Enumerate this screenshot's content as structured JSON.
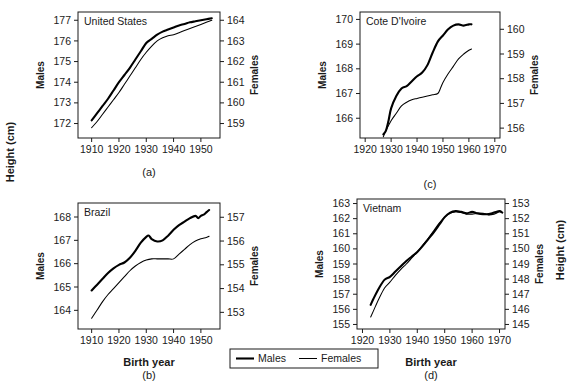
{
  "figure": {
    "global_ylabel_left": "Height (cm)",
    "global_ylabel_right": "Height (cm)",
    "global_xlabel": "Birth year",
    "axis_label_males": "Males",
    "axis_label_females": "Females",
    "legend": {
      "position": "bottom-center",
      "entries": [
        {
          "label": "Males",
          "color": "#000000",
          "width": 2.2
        },
        {
          "label": "Females",
          "color": "#000000",
          "width": 1.1
        }
      ]
    },
    "panel_captions": [
      "(a)",
      "(b)",
      "(c)",
      "(d)"
    ]
  },
  "chart_data": [
    {
      "panel": "(a)",
      "type": "line",
      "title": "United States",
      "xlabel": "Birth year",
      "ylabel_left": "Males",
      "ylabel_right": "Females",
      "xlim": [
        1905,
        1957
      ],
      "xticks": [
        1910,
        1920,
        1930,
        1940,
        1950
      ],
      "ylim_left": [
        171.3,
        177.4
      ],
      "yticks_left": [
        172,
        173,
        174,
        175,
        176,
        177
      ],
      "ylim_right": [
        158.3,
        164.4
      ],
      "yticks_right": [
        159,
        160,
        161,
        162,
        163,
        164
      ],
      "grid": false,
      "series": [
        {
          "name": "Males",
          "axis": "left",
          "x": [
            1910,
            1912,
            1914,
            1916,
            1918,
            1920,
            1922,
            1924,
            1926,
            1928,
            1930,
            1932,
            1934,
            1936,
            1938,
            1940,
            1942,
            1944,
            1946,
            1948,
            1950,
            1952,
            1954
          ],
          "values": [
            172.15,
            172.5,
            172.85,
            173.2,
            173.6,
            174.0,
            174.35,
            174.7,
            175.1,
            175.5,
            175.9,
            176.1,
            176.3,
            176.45,
            176.55,
            176.65,
            176.75,
            176.82,
            176.9,
            176.95,
            177.0,
            177.05,
            177.1
          ]
        },
        {
          "name": "Females",
          "axis": "right",
          "x": [
            1910,
            1912,
            1914,
            1916,
            1918,
            1920,
            1922,
            1924,
            1926,
            1928,
            1930,
            1932,
            1934,
            1936,
            1938,
            1940,
            1942,
            1944,
            1946,
            1948,
            1950,
            1952,
            1954
          ],
          "values": [
            158.8,
            159.1,
            159.45,
            159.8,
            160.15,
            160.5,
            160.9,
            161.3,
            161.7,
            162.1,
            162.45,
            162.75,
            163.0,
            163.15,
            163.25,
            163.3,
            163.4,
            163.5,
            163.6,
            163.7,
            163.8,
            163.9,
            164.0
          ]
        }
      ]
    },
    {
      "panel": "(b)",
      "type": "line",
      "title": "Brazil",
      "xlabel": "Birth year",
      "ylabel_left": "Males",
      "ylabel_right": "Females",
      "xlim": [
        1905,
        1957
      ],
      "xticks": [
        1910,
        1920,
        1930,
        1940,
        1950
      ],
      "ylim_left": [
        163.2,
        168.6
      ],
      "yticks_left": [
        164,
        165,
        166,
        167,
        168
      ],
      "ylim_right": [
        152.3,
        157.6
      ],
      "yticks_right": [
        153,
        154,
        155,
        156,
        157
      ],
      "grid": false,
      "series": [
        {
          "name": "Males",
          "axis": "left",
          "x": [
            1910,
            1912,
            1914,
            1916,
            1918,
            1920,
            1922,
            1924,
            1926,
            1928,
            1930,
            1931,
            1932,
            1934,
            1936,
            1938,
            1940,
            1942,
            1944,
            1946,
            1948,
            1949,
            1950,
            1951,
            1952,
            1953
          ],
          "values": [
            164.85,
            165.1,
            165.35,
            165.6,
            165.8,
            165.95,
            166.05,
            166.25,
            166.55,
            166.9,
            167.15,
            167.2,
            167.05,
            166.95,
            167.0,
            167.2,
            167.45,
            167.65,
            167.8,
            167.95,
            168.05,
            167.95,
            168.05,
            168.1,
            168.2,
            168.3
          ]
        },
        {
          "name": "Females",
          "axis": "right",
          "x": [
            1910,
            1912,
            1914,
            1916,
            1918,
            1920,
            1922,
            1924,
            1926,
            1928,
            1930,
            1932,
            1934,
            1936,
            1938,
            1940,
            1942,
            1944,
            1946,
            1948,
            1950,
            1952,
            1953
          ],
          "values": [
            152.75,
            153.1,
            153.45,
            153.75,
            154.0,
            154.25,
            154.5,
            154.75,
            154.95,
            155.1,
            155.2,
            155.25,
            155.25,
            155.25,
            155.25,
            155.25,
            155.45,
            155.65,
            155.85,
            156.0,
            156.1,
            156.15,
            156.2
          ]
        }
      ]
    },
    {
      "panel": "(c)",
      "type": "line",
      "title": "Cote D'Ivoire",
      "xlabel": "Birth year",
      "ylabel_left": "Males",
      "ylabel_right": "Females",
      "xlim": [
        1918,
        1972
      ],
      "xticks": [
        1920,
        1930,
        1940,
        1950,
        1960,
        1970
      ],
      "ylim_left": [
        165.2,
        170.3
      ],
      "yticks_left": [
        166,
        167,
        168,
        169,
        170
      ],
      "ylim_right": [
        155.6,
        160.7
      ],
      "yticks_right": [
        156,
        157,
        158,
        159,
        160
      ],
      "grid": false,
      "series": [
        {
          "name": "Males",
          "axis": "left",
          "x": [
            1927,
            1928,
            1929,
            1930,
            1932,
            1934,
            1936,
            1938,
            1940,
            1942,
            1944,
            1946,
            1948,
            1950,
            1952,
            1954,
            1956,
            1958,
            1960,
            1961
          ],
          "values": [
            165.35,
            165.5,
            165.9,
            166.4,
            166.9,
            167.2,
            167.3,
            167.5,
            167.7,
            167.85,
            168.15,
            168.65,
            169.1,
            169.35,
            169.6,
            169.75,
            169.8,
            169.75,
            169.8,
            169.8
          ]
        },
        {
          "name": "Females",
          "axis": "right",
          "x": [
            1927,
            1928,
            1930,
            1932,
            1934,
            1936,
            1938,
            1940,
            1942,
            1944,
            1946,
            1948,
            1949,
            1950,
            1952,
            1954,
            1956,
            1958,
            1960,
            1961
          ],
          "values": [
            155.65,
            155.9,
            156.3,
            156.6,
            156.9,
            157.05,
            157.15,
            157.2,
            157.25,
            157.3,
            157.35,
            157.4,
            157.6,
            157.85,
            158.2,
            158.5,
            158.8,
            159.0,
            159.15,
            159.2
          ]
        }
      ]
    },
    {
      "panel": "(d)",
      "type": "line",
      "title": "Vietnam",
      "xlabel": "Birth year",
      "ylabel_left": "Males",
      "ylabel_right": "Females",
      "xlim": [
        1918,
        1972
      ],
      "xticks": [
        1920,
        1930,
        1940,
        1950,
        1960,
        1970
      ],
      "ylim_left": [
        154.7,
        163.3
      ],
      "yticks_left": [
        155,
        156,
        157,
        158,
        159,
        160,
        161,
        162,
        163
      ],
      "ylim_right": [
        144.7,
        153.3
      ],
      "yticks_right": [
        145,
        146,
        147,
        148,
        149,
        150,
        151,
        152,
        153
      ],
      "grid": false,
      "series": [
        {
          "name": "Males",
          "axis": "left",
          "x": [
            1923,
            1924,
            1926,
            1928,
            1930,
            1932,
            1934,
            1936,
            1938,
            1940,
            1942,
            1944,
            1946,
            1948,
            1950,
            1952,
            1954,
            1956,
            1958,
            1960,
            1962,
            1964,
            1966,
            1968,
            1970,
            1971
          ],
          "values": [
            156.3,
            156.7,
            157.4,
            157.95,
            158.15,
            158.5,
            158.85,
            159.2,
            159.5,
            159.8,
            160.2,
            160.65,
            161.1,
            161.6,
            162.1,
            162.4,
            162.5,
            162.45,
            162.35,
            162.45,
            162.35,
            162.3,
            162.3,
            162.4,
            162.5,
            162.4
          ]
        },
        {
          "name": "Females",
          "axis": "right",
          "x": [
            1923,
            1924,
            1926,
            1928,
            1930,
            1932,
            1934,
            1936,
            1938,
            1940,
            1942,
            1944,
            1946,
            1948,
            1950,
            1952,
            1954,
            1956,
            1958,
            1960,
            1962,
            1964,
            1966,
            1968,
            1970,
            1971
          ],
          "values": [
            145.5,
            145.9,
            146.7,
            147.4,
            147.8,
            148.25,
            148.65,
            149.0,
            149.4,
            149.8,
            150.25,
            150.7,
            151.2,
            151.7,
            152.1,
            152.35,
            152.45,
            152.4,
            152.3,
            152.3,
            152.35,
            152.35,
            152.25,
            152.3,
            152.45,
            152.4
          ]
        }
      ]
    }
  ]
}
